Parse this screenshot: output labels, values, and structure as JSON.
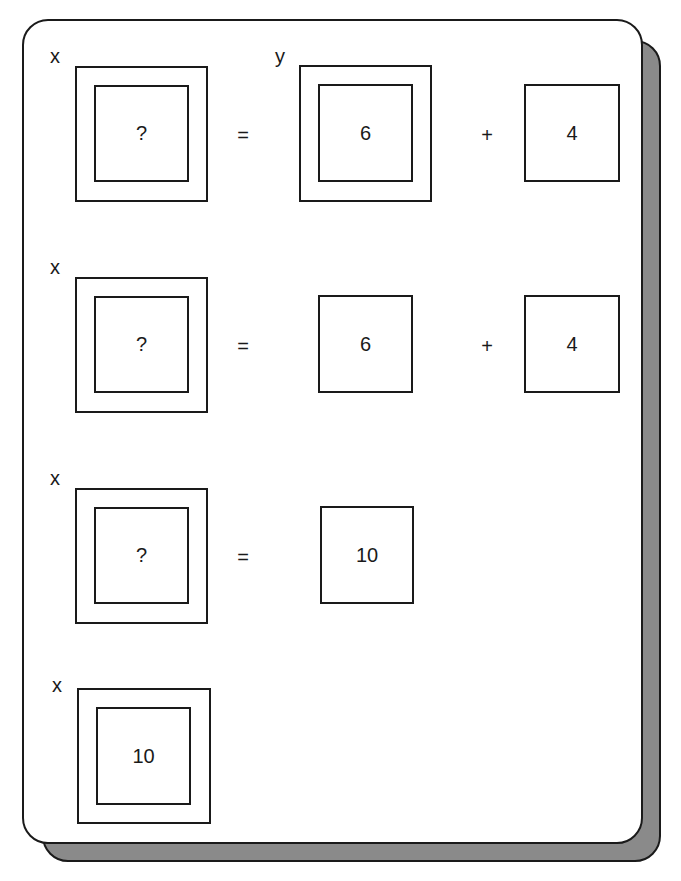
{
  "steps": [
    {
      "left_label": "x",
      "left_value": "?",
      "equals": "=",
      "right_label": "y",
      "right_a": "6",
      "plus": "+",
      "right_b": "4"
    },
    {
      "left_label": "x",
      "left_value": "?",
      "equals": "=",
      "right_a": "6",
      "plus": "+",
      "right_b": "4"
    },
    {
      "left_label": "x",
      "left_value": "?",
      "equals": "=",
      "right_a": "10"
    },
    {
      "left_label": "x",
      "left_value": "10"
    }
  ]
}
